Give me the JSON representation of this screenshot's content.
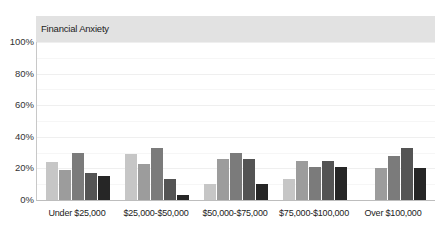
{
  "chart_data": {
    "type": "bar",
    "title": "Financial Anxiety",
    "xlabel": "",
    "ylabel": "",
    "ylim": [
      0,
      100
    ],
    "yticks": [
      "0%",
      "20%",
      "40%",
      "60%",
      "80%",
      "100%"
    ],
    "grid": true,
    "legend": null,
    "categories": [
      "Under $25,000",
      "$25,000-$50,000",
      "$50,000-$75,000",
      "$75,000-$100,000",
      "Over $100,000"
    ],
    "series": [
      {
        "name": "Series 1",
        "color": "#c6c6c6",
        "values": [
          24,
          29,
          10,
          13,
          0
        ]
      },
      {
        "name": "Series 2",
        "color": "#9c9c9c",
        "values": [
          19,
          23,
          26,
          25,
          20
        ]
      },
      {
        "name": "Series 3",
        "color": "#7b7b7b",
        "values": [
          30,
          33,
          30,
          21,
          28
        ]
      },
      {
        "name": "Series 4",
        "color": "#545454",
        "values": [
          17,
          13,
          26,
          25,
          33
        ]
      },
      {
        "name": "Series 5",
        "color": "#262626",
        "values": [
          15,
          3,
          10,
          21,
          20
        ]
      }
    ]
  }
}
